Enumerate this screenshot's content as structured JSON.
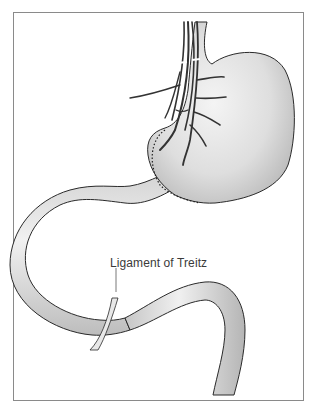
{
  "figure": {
    "labels": [
      {
        "text": "Ligament of Treitz"
      }
    ]
  },
  "colors": {
    "frame": "#8a8a8a",
    "organ_fill": "#d9d9d9",
    "organ_highlight": "#f2f2f2",
    "outline": "#2a2a2a",
    "vessels": "#333333",
    "sutures": "#222222"
  }
}
